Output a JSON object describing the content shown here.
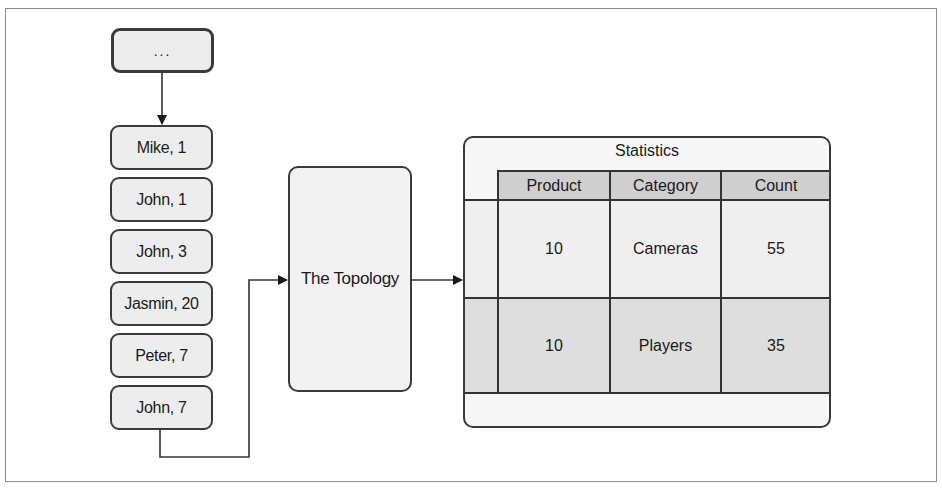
{
  "diagram": {
    "source_node": {
      "label": "..."
    },
    "stream_items": [
      {
        "label": "Mike, 1"
      },
      {
        "label": "John, 1"
      },
      {
        "label": "John, 3"
      },
      {
        "label": "Jasmin, 20"
      },
      {
        "label": "Peter, 7"
      },
      {
        "label": "John, 7"
      }
    ],
    "topology": {
      "label": "The Topology"
    },
    "statistics": {
      "title": "Statistics",
      "columns": [
        "Product",
        "Category",
        "Count"
      ],
      "rows": [
        [
          "10",
          "Cameras",
          "55"
        ],
        [
          "10",
          "Players",
          "35"
        ]
      ]
    },
    "colors": {
      "stroke": "#333333",
      "node_fill": "#ededed",
      "header_fill": "#cfcfcf",
      "row1_fill": "#efefef",
      "row2_fill": "#dedede",
      "frame": "#8c8c8c"
    }
  }
}
